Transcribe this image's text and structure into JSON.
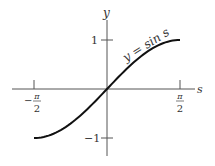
{
  "chart_data": {
    "type": "line",
    "title": "",
    "xlabel": "s",
    "ylabel": "y",
    "xlim": [
      -1.5708,
      1.5708
    ],
    "ylim": [
      -1,
      1
    ],
    "x_ticks": [
      {
        "value": -1.5708,
        "label_num": "π",
        "label_den": "2",
        "sign": "−"
      },
      {
        "value": 1.5708,
        "label_num": "π",
        "label_den": "2",
        "sign": ""
      }
    ],
    "y_ticks": [
      {
        "value": 1,
        "label": "1"
      },
      {
        "value": -1,
        "label": "−1"
      }
    ],
    "grid": false,
    "series": [
      {
        "name": "y = sin s",
        "x": [
          -1.5708,
          -1.1781,
          -0.7854,
          -0.3927,
          0,
          0.3927,
          0.7854,
          1.1781,
          1.5708
        ],
        "values": [
          -1,
          -0.9239,
          -0.7071,
          -0.3827,
          0,
          0.3827,
          0.7071,
          0.9239,
          1
        ]
      }
    ],
    "annotations": [
      {
        "text": "y = sin s",
        "position": "along curve, upper right"
      }
    ]
  },
  "labels": {
    "y_axis": "y",
    "x_axis": "s",
    "curve": "y = sin s",
    "y_tick_top": "1",
    "y_tick_bottom": "−1",
    "x_tick_left_sign": "−",
    "x_tick_num": "π",
    "x_tick_den": "2"
  }
}
